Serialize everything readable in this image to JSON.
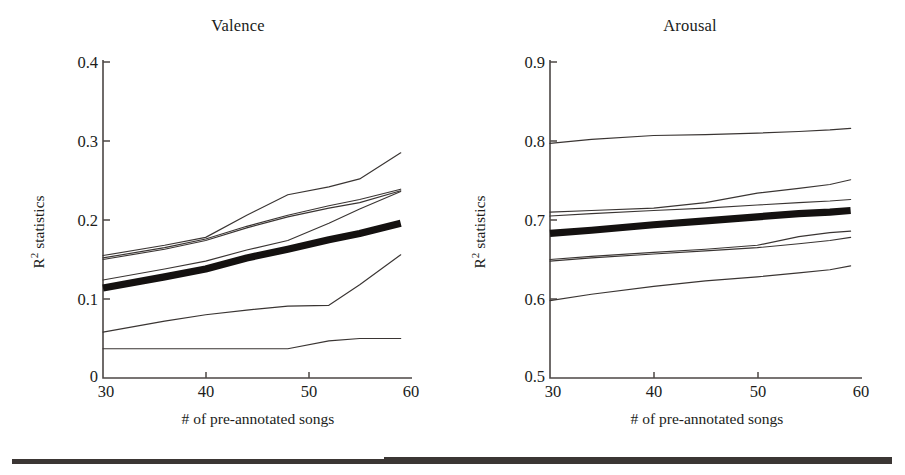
{
  "figure": {
    "background": "#ffffff",
    "ink_color": "#201c1a",
    "accent_color": "#141110",
    "bottom_rule": "horizontal-black-rule"
  },
  "panels": [
    {
      "id": "valence",
      "title": "Valence"
    },
    {
      "id": "arousal",
      "title": "Arousal"
    }
  ],
  "axes": {
    "xlabel": "# of pre-annotated songs",
    "ylabel_base": "R",
    "ylabel_sup": "2",
    "ylabel_rest": " statistics",
    "x_ticks": [
      "30",
      "40",
      "50",
      "60"
    ],
    "valence_y_ticks": [
      "0",
      "0.1",
      "0.2",
      "0.3",
      "0.4"
    ],
    "arousal_y_ticks": [
      "0.5",
      "0.6",
      "0.7",
      "0.8",
      "0.9"
    ]
  },
  "chart_data": [
    {
      "type": "line",
      "title": "Valence",
      "xlabel": "# of pre-annotated songs",
      "ylabel": "R2 statistics",
      "xlim": [
        30,
        60
      ],
      "ylim": [
        0,
        0.4
      ],
      "xticks": [
        30,
        40,
        50,
        60
      ],
      "yticks": [
        0,
        0.1,
        0.2,
        0.3,
        0.4
      ],
      "grid": false,
      "legend": "none",
      "x": [
        30,
        36,
        40,
        44,
        48,
        52,
        55,
        59
      ],
      "series": [
        {
          "name": "curve-top",
          "emphasis": "thin",
          "values": [
            0.155,
            0.168,
            0.178,
            0.206,
            0.232,
            0.242,
            0.252,
            0.285
          ]
        },
        {
          "name": "curve-second",
          "emphasis": "thin",
          "values": [
            0.152,
            0.165,
            0.176,
            0.192,
            0.206,
            0.218,
            0.226,
            0.239
          ]
        },
        {
          "name": "curve-third",
          "emphasis": "thin",
          "values": [
            0.15,
            0.163,
            0.174,
            0.19,
            0.204,
            0.215,
            0.222,
            0.237
          ]
        },
        {
          "name": "curve-mean-bold",
          "emphasis": "thick",
          "values": [
            0.114,
            0.128,
            0.138,
            0.152,
            0.163,
            0.175,
            0.183,
            0.196
          ]
        },
        {
          "name": "curve-rising-mid",
          "emphasis": "thin",
          "values": [
            0.124,
            0.138,
            0.148,
            0.162,
            0.174,
            0.196,
            0.214,
            0.236
          ]
        },
        {
          "name": "curve-lower-rising",
          "emphasis": "thin",
          "values": [
            0.058,
            0.072,
            0.08,
            0.086,
            0.091,
            0.092,
            0.118,
            0.156
          ]
        },
        {
          "name": "curve-bottom-flat",
          "emphasis": "thin",
          "values": [
            0.037,
            0.037,
            0.037,
            0.037,
            0.037,
            0.047,
            0.05,
            0.05
          ]
        }
      ]
    },
    {
      "type": "line",
      "title": "Arousal",
      "xlabel": "# of pre-annotated songs",
      "ylabel": "R2 statistics",
      "xlim": [
        30,
        60
      ],
      "ylim": [
        0.5,
        0.9
      ],
      "xticks": [
        30,
        40,
        50,
        60
      ],
      "yticks": [
        0.5,
        0.6,
        0.7,
        0.8,
        0.9
      ],
      "grid": false,
      "legend": "none",
      "x": [
        30,
        34,
        40,
        45,
        50,
        54,
        57,
        59
      ],
      "series": [
        {
          "name": "curve-top",
          "emphasis": "thin",
          "values": [
            0.797,
            0.802,
            0.807,
            0.808,
            0.81,
            0.812,
            0.814,
            0.816
          ]
        },
        {
          "name": "curve-rising-high",
          "emphasis": "thin",
          "values": [
            0.71,
            0.712,
            0.715,
            0.722,
            0.734,
            0.74,
            0.745,
            0.751
          ]
        },
        {
          "name": "curve-second",
          "emphasis": "thin",
          "values": [
            0.705,
            0.708,
            0.712,
            0.715,
            0.719,
            0.722,
            0.724,
            0.726
          ]
        },
        {
          "name": "curve-mean-bold",
          "emphasis": "thick",
          "values": [
            0.683,
            0.687,
            0.694,
            0.699,
            0.704,
            0.708,
            0.71,
            0.712
          ]
        },
        {
          "name": "curve-mid-upper",
          "emphasis": "thin",
          "values": [
            0.65,
            0.654,
            0.659,
            0.663,
            0.668,
            0.679,
            0.684,
            0.686
          ]
        },
        {
          "name": "curve-mid-lower",
          "emphasis": "thin",
          "values": [
            0.648,
            0.652,
            0.657,
            0.661,
            0.665,
            0.67,
            0.674,
            0.678
          ]
        },
        {
          "name": "curve-bottom-rising",
          "emphasis": "thin",
          "values": [
            0.598,
            0.606,
            0.616,
            0.623,
            0.628,
            0.633,
            0.637,
            0.642
          ]
        }
      ]
    }
  ]
}
